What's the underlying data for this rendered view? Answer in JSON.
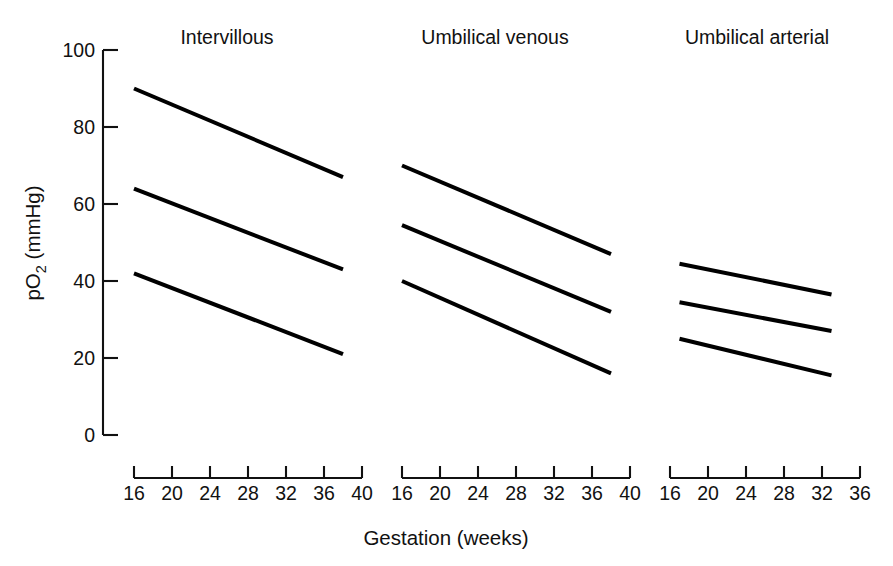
{
  "chart_data": {
    "type": "line",
    "title": "",
    "xlabel": "Gestation (weeks)",
    "ylabel_main": "pO",
    "ylabel_sub": "2",
    "ylabel_unit": " (mmHg)",
    "ylabel_full": "pO2 (mmHg)",
    "ylim": [
      0,
      100
    ],
    "yticks": [
      0,
      20,
      40,
      60,
      80,
      100
    ],
    "grid": false,
    "legend": "none",
    "panels": [
      {
        "name": "Intervillous",
        "xlim": [
          16,
          40
        ],
        "xticks": [
          16,
          20,
          24,
          28,
          32,
          36,
          40
        ],
        "series": [
          {
            "name": "upper-limit",
            "x": [
              16,
              38
            ],
            "values": [
              90,
              67
            ]
          },
          {
            "name": "mean",
            "x": [
              16,
              38
            ],
            "values": [
              64,
              43
            ]
          },
          {
            "name": "lower-limit",
            "x": [
              16,
              38
            ],
            "values": [
              42,
              21
            ]
          }
        ]
      },
      {
        "name": "Umbilical venous",
        "xlim": [
          16,
          40
        ],
        "xticks": [
          16,
          20,
          24,
          28,
          32,
          36,
          40
        ],
        "series": [
          {
            "name": "upper-limit",
            "x": [
              16,
              38
            ],
            "values": [
              70,
              47
            ]
          },
          {
            "name": "mean",
            "x": [
              16,
              38
            ],
            "values": [
              54.5,
              32
            ]
          },
          {
            "name": "lower-limit",
            "x": [
              16,
              38
            ],
            "values": [
              40,
              16
            ]
          }
        ]
      },
      {
        "name": "Umbilical arterial",
        "xlim": [
          16,
          36
        ],
        "xticks": [
          16,
          20,
          24,
          28,
          32,
          36
        ],
        "series": [
          {
            "name": "upper-limit",
            "x": [
              17,
              33
            ],
            "values": [
              44.5,
              36.5
            ]
          },
          {
            "name": "mean",
            "x": [
              17,
              33
            ],
            "values": [
              34.5,
              27
            ]
          },
          {
            "name": "lower-limit",
            "x": [
              17,
              33
            ],
            "values": [
              25,
              15.5
            ]
          }
        ]
      }
    ]
  },
  "figure": {
    "background_color": "#ffffff",
    "line_color": "#000000",
    "axis_color": "#111111"
  }
}
